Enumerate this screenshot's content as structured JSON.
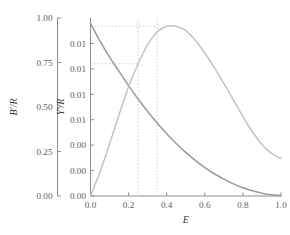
{
  "chart_data": {
    "type": "line",
    "title": "",
    "xlabel": "E",
    "ylabel_left": "B'/R",
    "ylabel_right": "Y'/R",
    "grid": false,
    "legend": false,
    "xlim": [
      0.0,
      1.0
    ],
    "xticks": [
      "0.0",
      "0.2",
      "0.4",
      "0.6",
      "0.8",
      "1.0"
    ],
    "xtick_values": [
      0.0,
      0.2,
      0.4,
      0.6,
      0.8,
      1.0
    ],
    "left_axis": {
      "label": "B'/R",
      "ylim": [
        0.0,
        1.0
      ],
      "yticks": [
        "0.00",
        "0.25",
        "0.50",
        "0.75",
        "1.00"
      ],
      "ytick_values": [
        0.0,
        0.25,
        0.5,
        0.75,
        1.0
      ]
    },
    "right_axis": {
      "label": "Y'/R",
      "ylim": [
        0.0,
        0.014
      ],
      "yticks": [
        "0.00",
        "0.00",
        "0.00",
        "0.01",
        "0.01",
        "0.01",
        "0.01"
      ],
      "ytick_values": [
        0.0,
        0.002,
        0.004,
        0.006,
        0.008,
        0.01,
        0.012
      ]
    },
    "series": [
      {
        "name": "B'/R",
        "axis": "left",
        "color": "#9a9a9a",
        "x": [
          0.0,
          0.05,
          0.1,
          0.15,
          0.2,
          0.25,
          0.3,
          0.35,
          0.4,
          0.45,
          0.5,
          0.55,
          0.6,
          0.65,
          0.7,
          0.75,
          0.8,
          0.85,
          0.9,
          0.95,
          1.0
        ],
        "values": [
          0.97,
          0.87,
          0.78,
          0.7,
          0.62,
          0.545,
          0.475,
          0.41,
          0.35,
          0.295,
          0.245,
          0.2,
          0.16,
          0.125,
          0.095,
          0.068,
          0.046,
          0.029,
          0.016,
          0.007,
          0.002
        ]
      },
      {
        "name": "Y'/R",
        "axis": "right",
        "color": "#c2c2c2",
        "x": [
          0.0,
          0.05,
          0.1,
          0.15,
          0.2,
          0.25,
          0.3,
          0.35,
          0.4,
          0.45,
          0.5,
          0.55,
          0.6,
          0.65,
          0.7,
          0.75,
          0.8,
          0.85,
          0.9,
          0.95,
          1.0
        ],
        "values": [
          0.0,
          0.0019,
          0.0041,
          0.0064,
          0.0086,
          0.0104,
          0.0119,
          0.0129,
          0.01335,
          0.01335,
          0.013,
          0.01225,
          0.01125,
          0.0101,
          0.00885,
          0.00755,
          0.00625,
          0.00505,
          0.00405,
          0.00335,
          0.00295
        ]
      }
    ],
    "annotations": [
      {
        "name": "peak-vertical-guide",
        "type": "vline",
        "x": 0.35,
        "color": "#c9c9c9"
      },
      {
        "name": "intersect-vertical-guide",
        "type": "vline",
        "x": 0.25,
        "color": "#c9c9c9"
      },
      {
        "name": "peak-horizontal-guide",
        "type": "hline",
        "y": 0.01335,
        "axis": "right",
        "color": "#c9c9c9"
      },
      {
        "name": "intersect-horizontal-guide",
        "type": "hline",
        "y": 0.0104,
        "axis": "right",
        "color": "#c9c9c9"
      }
    ]
  }
}
